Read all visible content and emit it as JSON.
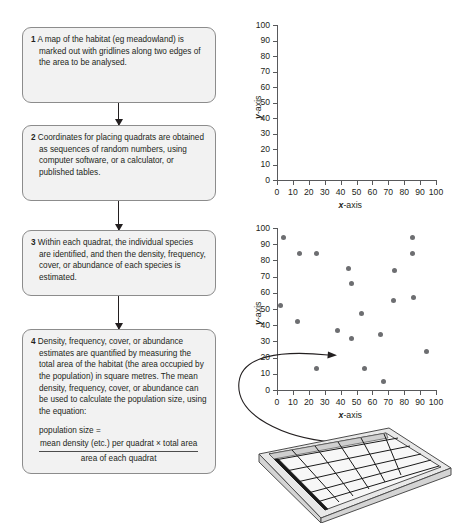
{
  "flowchart": {
    "steps": [
      {
        "number": "1",
        "text": "A map of the habitat (eg meadowland) is marked out with gridlines along two edges of the area to be analysed."
      },
      {
        "number": "2",
        "text": "Coordinates for placing quadrats are obtained as sequences of random numbers, using computer software, or a calculator, or published tables."
      },
      {
        "number": "3",
        "text": "Within each quadrat, the individual species are identified, and then the density, frequency, cover, or abundance of each species is estimated."
      },
      {
        "number": "4",
        "text": "Density, frequency, cover, or abundance estimates are quantified by measuring the total area of the habitat (the area occupied by the population) in square metres. The mean density, frequency, cover, or abundance can be used to calculate the population size, using the equation:",
        "equation": {
          "lhs": "population size =",
          "numerator": "mean density (etc.) per quadrat × total area",
          "denominator": "area of each quadrat"
        }
      }
    ]
  },
  "chart_data": [
    {
      "id": "grid-axes",
      "type": "scatter",
      "title": "",
      "xlabel": "x-axis",
      "ylabel": "y-axis",
      "xlim": [
        0,
        100
      ],
      "ylim": [
        0,
        100
      ],
      "xticks": [
        0,
        10,
        20,
        30,
        40,
        50,
        60,
        70,
        80,
        90,
        100
      ],
      "yticks": [
        0,
        10,
        20,
        30,
        40,
        50,
        60,
        70,
        80,
        90,
        100
      ],
      "grid": false,
      "points": []
    },
    {
      "id": "quadrat-scatter",
      "type": "scatter",
      "title": "",
      "xlabel": "x-axis",
      "ylabel": "y-axis",
      "xlim": [
        0,
        100
      ],
      "ylim": [
        0,
        100
      ],
      "xticks": [
        0,
        10,
        20,
        30,
        40,
        50,
        60,
        70,
        80,
        90,
        100
      ],
      "yticks": [
        0,
        10,
        20,
        30,
        40,
        50,
        60,
        70,
        80,
        90,
        100
      ],
      "grid": false,
      "points": [
        {
          "x": 4,
          "y": 94
        },
        {
          "x": 14,
          "y": 84
        },
        {
          "x": 25,
          "y": 84
        },
        {
          "x": 2,
          "y": 52
        },
        {
          "x": 13,
          "y": 42
        },
        {
          "x": 25,
          "y": 13
        },
        {
          "x": 38,
          "y": 37
        },
        {
          "x": 45,
          "y": 75
        },
        {
          "x": 47,
          "y": 66
        },
        {
          "x": 47,
          "y": 32
        },
        {
          "x": 53,
          "y": 47
        },
        {
          "x": 55,
          "y": 13
        },
        {
          "x": 65,
          "y": 34
        },
        {
          "x": 67,
          "y": 5
        },
        {
          "x": 74,
          "y": 74
        },
        {
          "x": 73,
          "y": 55
        },
        {
          "x": 85,
          "y": 94
        },
        {
          "x": 85,
          "y": 84
        },
        {
          "x": 86,
          "y": 57
        },
        {
          "x": 94,
          "y": 24
        }
      ],
      "annotation": {
        "type": "curved-arrow",
        "from": "quadrat-illustration",
        "to_point": {
          "x": 38,
          "y": 37
        }
      }
    }
  ],
  "quadrat_illustration": {
    "label": "quadrat frame with grid",
    "rows": 5,
    "cols": 5
  }
}
